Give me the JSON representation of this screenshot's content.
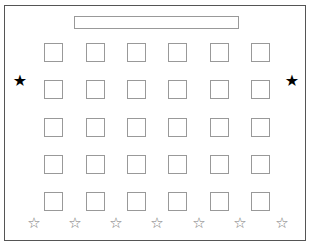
{
  "layout": {
    "board": {
      "label": ""
    },
    "desks": {
      "columns": [
        44,
        86,
        127,
        168,
        210,
        251
      ],
      "rows": [
        43,
        80,
        118,
        155,
        192
      ]
    },
    "filled_stars": [
      {
        "x": 12,
        "y": 73,
        "glyph": "★"
      },
      {
        "x": 284,
        "y": 73,
        "glyph": "★"
      }
    ],
    "outline_stars": [
      {
        "x": 26,
        "y": 216,
        "glyph": "☆"
      },
      {
        "x": 67,
        "y": 216,
        "glyph": "☆"
      },
      {
        "x": 108,
        "y": 216,
        "glyph": "☆"
      },
      {
        "x": 149,
        "y": 216,
        "glyph": "☆"
      },
      {
        "x": 191,
        "y": 216,
        "glyph": "☆"
      },
      {
        "x": 232,
        "y": 216,
        "glyph": "☆"
      },
      {
        "x": 274,
        "y": 216,
        "glyph": "☆"
      }
    ]
  }
}
